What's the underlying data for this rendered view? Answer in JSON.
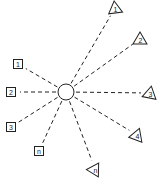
{
  "diagram": {
    "type": "hub-and-spoke",
    "stroke_color": "#222222",
    "background": "#ffffff",
    "hub": {
      "shape": "circle",
      "cx": 66,
      "cy": 92,
      "r": 8
    },
    "left_nodes": [
      {
        "label": "1",
        "shape": "square",
        "x": 18,
        "y": 64
      },
      {
        "label": "2",
        "shape": "square",
        "x": 11,
        "y": 92
      },
      {
        "label": "3",
        "shape": "square",
        "x": 11,
        "y": 127
      },
      {
        "label": "n",
        "shape": "square",
        "x": 39,
        "y": 151
      }
    ],
    "right_nodes": [
      {
        "label": "1",
        "shape": "triangle",
        "x": 115,
        "y": 8
      },
      {
        "label": "2",
        "shape": "triangle",
        "x": 140,
        "y": 39
      },
      {
        "label": "3",
        "shape": "triangle",
        "x": 150,
        "y": 93
      },
      {
        "label": "4",
        "shape": "triangle",
        "x": 137,
        "y": 135
      },
      {
        "label": "n",
        "shape": "triangle",
        "x": 95,
        "y": 169
      }
    ]
  }
}
